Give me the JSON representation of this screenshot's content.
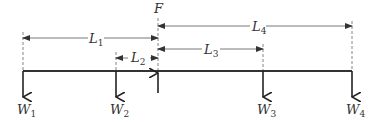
{
  "diagram": {
    "type": "beam-free-body",
    "force": {
      "label": "F",
      "x": 158,
      "direction": "up"
    },
    "beam": {
      "x1": 23,
      "x2": 352,
      "y": 71
    },
    "loads": [
      {
        "label": "W",
        "sub": "1",
        "x": 23,
        "direction": "down"
      },
      {
        "label": "W",
        "sub": "2",
        "x": 116,
        "direction": "down"
      },
      {
        "label": "W",
        "sub": "3",
        "x": 263,
        "direction": "down"
      },
      {
        "label": "W",
        "sub": "4",
        "x": 352,
        "direction": "down"
      }
    ],
    "dimensions": [
      {
        "label": "L",
        "sub": "1",
        "from": 23,
        "to": 158,
        "y": 38
      },
      {
        "label": "L",
        "sub": "2",
        "from": 116,
        "to": 158,
        "y": 58
      },
      {
        "label": "L",
        "sub": "3",
        "from": 158,
        "to": 263,
        "y": 49
      },
      {
        "label": "L",
        "sub": "4",
        "from": 158,
        "to": 352,
        "y": 26
      }
    ],
    "colors": {
      "line": "#333333",
      "dim": "#555555",
      "background": "#ffffff"
    }
  }
}
